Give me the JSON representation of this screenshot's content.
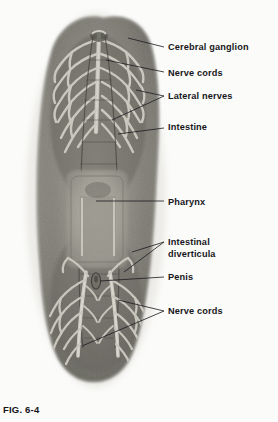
{
  "figure": {
    "caption": "FIG. 6-4",
    "background_color": "#fbfbfa",
    "specimen_color_dark": "#3a3a38",
    "specimen_color_mid": "#8d8c86",
    "specimen_color_light": "#c9c7c0",
    "label_color": "#17171a",
    "leader_color": "#1b1b1f"
  },
  "labels": [
    {
      "id": "cerebral-ganglion",
      "text": "Cerebral ganglion",
      "x": 168,
      "y": 42
    },
    {
      "id": "nerve-cords-top",
      "text": "Nerve cords",
      "x": 168,
      "y": 68
    },
    {
      "id": "lateral-nerves",
      "text": "Lateral nerves",
      "x": 168,
      "y": 91
    },
    {
      "id": "intestine",
      "text": "Intestine",
      "x": 168,
      "y": 122
    },
    {
      "id": "pharynx",
      "text": "Pharynx",
      "x": 168,
      "y": 197
    },
    {
      "id": "intestinal-diverticula-line1",
      "text": "Intestinal",
      "x": 168,
      "y": 237
    },
    {
      "id": "intestinal-diverticula-line2",
      "text": "diverticula",
      "x": 168,
      "y": 249
    },
    {
      "id": "penis",
      "text": "Penis",
      "x": 168,
      "y": 272
    },
    {
      "id": "nerve-cords-bottom",
      "text": "Nerve cords",
      "x": 168,
      "y": 306
    }
  ],
  "anatomy_structures": [
    "cerebral ganglion",
    "nerve cords",
    "lateral nerves",
    "intestine",
    "pharynx",
    "intestinal diverticula",
    "penis"
  ]
}
